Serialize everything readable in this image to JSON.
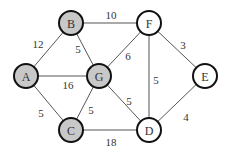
{
  "graph": {
    "nodes": [
      {
        "id": "A",
        "label": "A",
        "x": 26,
        "y": 76,
        "fill": "#c8c8c8"
      },
      {
        "id": "B",
        "label": "B",
        "x": 71,
        "y": 23,
        "fill": "#c8c8c8"
      },
      {
        "id": "C",
        "label": "C",
        "x": 71,
        "y": 130,
        "fill": "#c8c8c8"
      },
      {
        "id": "G",
        "label": "G",
        "x": 99,
        "y": 76,
        "fill": "#c8c8c8"
      },
      {
        "id": "F",
        "label": "F",
        "x": 149,
        "y": 23,
        "fill": "#ffffff"
      },
      {
        "id": "D",
        "label": "D",
        "x": 149,
        "y": 130,
        "fill": "#ffffff"
      },
      {
        "id": "E",
        "label": "E",
        "x": 205,
        "y": 76,
        "fill": "#ffffff"
      }
    ],
    "edges": [
      {
        "from": "A",
        "to": "B",
        "weight": "12",
        "lx": 38,
        "ly": 44
      },
      {
        "from": "A",
        "to": "G",
        "weight": "16",
        "lx": 68,
        "ly": 85
      },
      {
        "from": "A",
        "to": "C",
        "weight": "5",
        "lx": 41,
        "ly": 113
      },
      {
        "from": "B",
        "to": "G",
        "weight": "5",
        "lx": 78,
        "ly": 49
      },
      {
        "from": "B",
        "to": "F",
        "weight": "10",
        "lx": 111,
        "ly": 15
      },
      {
        "from": "G",
        "to": "F",
        "weight": "6",
        "lx": 128,
        "ly": 56
      },
      {
        "from": "G",
        "to": "C",
        "weight": "5",
        "lx": 91,
        "ly": 110
      },
      {
        "from": "G",
        "to": "D",
        "weight": "5",
        "lx": 129,
        "ly": 101
      },
      {
        "from": "F",
        "to": "D",
        "weight": "5",
        "lx": 156,
        "ly": 80
      },
      {
        "from": "F",
        "to": "E",
        "weight": "3",
        "lx": 183,
        "ly": 45
      },
      {
        "from": "C",
        "to": "D",
        "weight": "18",
        "lx": 111,
        "ly": 142
      },
      {
        "from": "D",
        "to": "E",
        "weight": "4",
        "lx": 186,
        "ly": 117
      }
    ]
  }
}
